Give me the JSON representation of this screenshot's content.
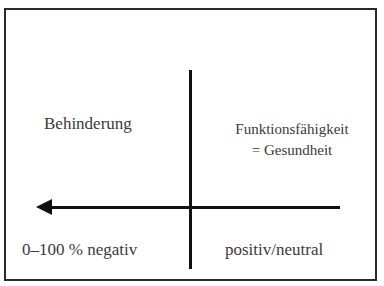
{
  "diagram": {
    "type": "quadrant-axis-diagram",
    "axes": {
      "vertical_line": "divider",
      "horizontal_arrow": {
        "direction": "left"
      }
    },
    "labels": {
      "top_left": "Behinderung",
      "top_right_line1": "Funktionsfähigkeit",
      "top_right_line2": "= Gesundheit",
      "bottom_left": "0–100 % negativ",
      "bottom_right": "positiv/neutral"
    },
    "colors": {
      "line": "#111111",
      "text": "#3a3a3a",
      "border": "#2a2a2a",
      "background": "#ffffff"
    }
  }
}
